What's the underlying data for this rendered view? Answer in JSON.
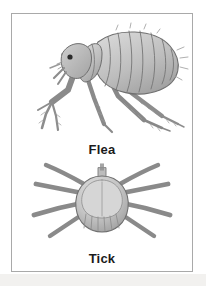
{
  "figure": {
    "border_color": "#a9a9a9",
    "background_color": "#ffffff",
    "page_tint_color": "#f2f1ef",
    "specimens": [
      {
        "label": "Flea",
        "icon_name": "flea-illustration",
        "view": "lateral profile, facing left",
        "ink_color": "#8c8c8c",
        "fill_color": "#c9c9c9",
        "eye_color": "#2b2b2b"
      },
      {
        "label": "Tick",
        "icon_name": "tick-illustration",
        "view": "dorsal, head up",
        "ink_color": "#8c8c8c",
        "fill_color": "#c2c2c2",
        "leg_count": 8
      }
    ]
  }
}
